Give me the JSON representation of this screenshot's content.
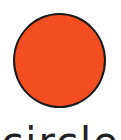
{
  "shape": {
    "type": "circle",
    "fill": "#F24E22",
    "stroke": "#1a1a1a"
  },
  "label": {
    "text": "circle"
  }
}
